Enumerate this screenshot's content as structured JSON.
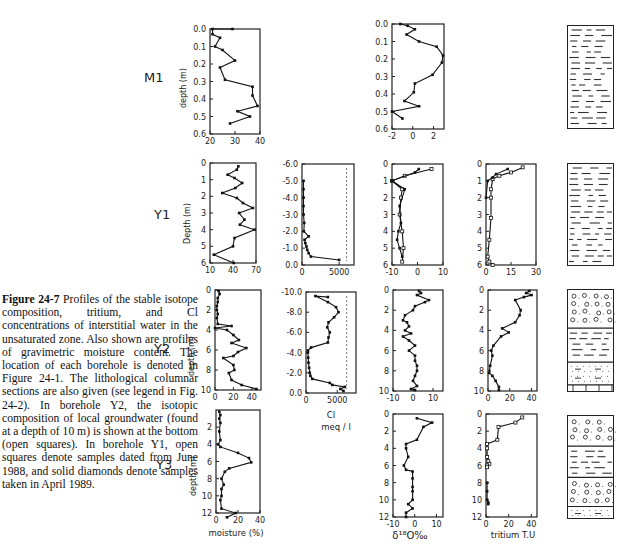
{
  "caption": {
    "figure_label": "Figure 24-7",
    "text": " Profiles of the stable isotope composition, tritium, and Cl concentrations of interstitial water in the unsaturated zone. Also shown are profiles of gravimetric moisture content. The location of each borehole is denoted in Figure 24-1. The lithological columnar sections are also given (see legend in Fig. 24-2). In borehole Y2, the isotopic composition of local groundwater (found at a depth of 10 m) is shown at the bottom (open squares). In borehole Y1, open squares denote samples dated from June 1988, and solid diamonds denote samples taken in April 1989."
  },
  "rows": [
    {
      "label": "M1",
      "ylabel": "depth (m)"
    },
    {
      "label": "Y1",
      "ylabel": "Depth (m)"
    },
    {
      "label": "Y2",
      "ylabel": "depth (m)"
    },
    {
      "label": "Y3",
      "ylabel": "depth (m)"
    }
  ],
  "x_labels": {
    "moisture": "moisture (%)",
    "cl": "Cl",
    "cl_unit": "meq / l",
    "d18o": "δ¹⁸O‰",
    "tritium": "tritium T.U"
  },
  "chart_data": [
    {
      "type": "line",
      "title": "M1 moisture",
      "xlabel": "moisture (%)",
      "ylabel": "depth (m)",
      "xlim": [
        20,
        40
      ],
      "ylim": [
        0.0,
        0.6
      ],
      "xticks": [
        20,
        30,
        40
      ],
      "yticks": [
        0.0,
        0.1,
        0.2,
        0.3,
        0.4,
        0.5,
        0.6
      ],
      "series": [
        {
          "name": "moisture",
          "x": [
            29,
            21,
            21,
            24,
            22,
            25,
            30,
            24,
            26,
            37,
            37,
            39,
            31,
            36,
            28
          ],
          "y": [
            0.0,
            0.0,
            0.03,
            0.05,
            0.1,
            0.12,
            0.18,
            0.22,
            0.29,
            0.33,
            0.38,
            0.44,
            0.47,
            0.5,
            0.54
          ]
        }
      ]
    },
    {
      "type": "line",
      "title": "M1 d18O",
      "xlabel": "δ18O ‰",
      "ylabel": "depth (m)",
      "xlim": [
        -2,
        3
      ],
      "ylim": [
        0.0,
        0.6
      ],
      "xticks": [
        -2,
        0,
        2
      ],
      "yticks": [
        0.0,
        0.1,
        0.2,
        0.3,
        0.4,
        0.5,
        0.6
      ],
      "series": [
        {
          "name": "d18O",
          "x": [
            -1.2,
            -0.5,
            0.2,
            -0.6,
            0.6,
            2.3,
            2.9,
            2.8,
            1.9,
            0.2,
            0.1,
            -0.8,
            0.6,
            -2.0,
            -1.0
          ],
          "y": [
            0.0,
            0.01,
            0.03,
            0.06,
            0.1,
            0.13,
            0.18,
            0.22,
            0.29,
            0.34,
            0.39,
            0.44,
            0.47,
            0.5,
            0.54
          ]
        }
      ]
    },
    {
      "type": "line",
      "title": "Y1 moisture",
      "xlabel": "moisture (%)",
      "ylabel": "Depth (m)",
      "xlim": [
        10,
        70
      ],
      "ylim": [
        0,
        6
      ],
      "xticks": [
        10,
        40,
        70
      ],
      "yticks": [
        0,
        1,
        2,
        3,
        4,
        5,
        6
      ],
      "series": [
        {
          "name": "moisture",
          "x": [
            47,
            45,
            33,
            42,
            52,
            43,
            26,
            45,
            53,
            66,
            48,
            55,
            49,
            68,
            42,
            40,
            15,
            41
          ],
          "y": [
            0.2,
            0.4,
            0.7,
            0.9,
            1.2,
            1.5,
            1.8,
            2.1,
            2.4,
            2.7,
            3.0,
            3.4,
            3.7,
            4.0,
            4.5,
            5.0,
            5.5,
            6.0
          ]
        }
      ]
    },
    {
      "type": "line",
      "title": "Y1 Cl",
      "xlabel": "Cl (meq/l)",
      "ylabel": "depth",
      "xlim": [
        0,
        7000
      ],
      "ylim": [
        -6,
        0
      ],
      "xticks": [
        0,
        5000
      ],
      "yticks": [
        0,
        -1,
        -2,
        -3,
        -4,
        -5,
        -6
      ],
      "series": [
        {
          "name": "Cl",
          "x": [
            5000,
            1200,
            900,
            700,
            600,
            450,
            350,
            900,
            250,
            300,
            200,
            200,
            200,
            200,
            200
          ],
          "y": [
            -0.3,
            -0.5,
            -0.7,
            -0.9,
            -1.1,
            -1.3,
            -1.5,
            -1.7,
            -2.0,
            -2.5,
            -3.0,
            -3.5,
            -4.0,
            -4.5,
            -5.0
          ]
        }
      ],
      "reference_line_x": 6000
    },
    {
      "type": "line",
      "title": "Y1 d18O",
      "xlabel": "δ18O ‰",
      "ylabel": "depth",
      "xlim": [
        -10,
        10
      ],
      "ylim": [
        0,
        6
      ],
      "xticks": [
        -10,
        0,
        10
      ],
      "yticks": [
        0,
        1,
        2,
        3,
        4,
        5,
        6
      ],
      "series": [
        {
          "name": "June 1988 (open squares)",
          "x": [
            5.5,
            -5,
            -10,
            -6,
            -6.5,
            -7,
            -6,
            -5.5,
            -6
          ],
          "y": [
            0.3,
            0.7,
            1.0,
            1.5,
            2.0,
            3.0,
            4.0,
            5.0,
            5.8
          ]
        },
        {
          "name": "April 1989 (solid diamonds)",
          "x": [
            0.5,
            -1,
            -10,
            -5,
            -7,
            -6.5,
            -7.5,
            -8,
            -7,
            -6
          ],
          "y": [
            0.3,
            0.5,
            1.0,
            1.5,
            2.5,
            3.5,
            4.0,
            4.5,
            5.0,
            5.5
          ]
        }
      ]
    },
    {
      "type": "line",
      "title": "Y1 tritium",
      "xlabel": "tritium T.U",
      "ylabel": "depth",
      "xlim": [
        0,
        30
      ],
      "ylim": [
        0,
        6
      ],
      "xticks": [
        0,
        15,
        30
      ],
      "yticks": [
        0,
        1,
        2,
        3,
        4,
        5,
        6
      ],
      "series": [
        {
          "name": "June 1988 (open squares)",
          "x": [
            22,
            15,
            8,
            4,
            3,
            3,
            3,
            2,
            1,
            2,
            4
          ],
          "y": [
            0.2,
            0.5,
            0.7,
            0.9,
            1.5,
            2.0,
            3.2,
            4.5,
            5.5,
            5.8,
            6.0
          ]
        },
        {
          "name": "April 1989 (solid diamonds)",
          "x": [
            13,
            6,
            4,
            1,
            0
          ],
          "y": [
            0.3,
            0.6,
            0.8,
            1.0,
            2.0
          ]
        }
      ]
    },
    {
      "type": "line",
      "title": "Y2 moisture",
      "xlabel": "moisture (%)",
      "ylabel": "depth (m)",
      "xlim": [
        0,
        50
      ],
      "ylim": [
        0,
        10
      ],
      "xticks": [
        0,
        20,
        40
      ],
      "yticks": [
        0,
        2,
        4,
        6,
        8,
        10
      ],
      "series": [
        {
          "name": "moisture",
          "x": [
            4,
            5,
            3,
            3,
            2,
            2,
            3,
            2,
            3,
            18,
            0,
            13,
            20,
            26,
            18,
            34,
            25,
            20,
            9,
            20,
            21,
            15,
            18,
            29,
            45
          ],
          "y": [
            0.1,
            0.4,
            0.8,
            1.2,
            1.6,
            2.0,
            2.4,
            2.8,
            3.4,
            3.6,
            3.8,
            4.0,
            4.5,
            5.0,
            5.3,
            5.8,
            6.2,
            6.6,
            6.8,
            7.5,
            8.0,
            8.3,
            9.0,
            9.5,
            9.9
          ]
        }
      ]
    },
    {
      "type": "line",
      "title": "Y2 Cl",
      "xlabel": "Cl (meq/l)",
      "ylabel": "depth",
      "xlim": [
        0,
        8000
      ],
      "ylim": [
        -10,
        0
      ],
      "xticks": [
        0,
        5000
      ],
      "yticks": [
        0,
        -2,
        -4,
        -6,
        -8,
        -10
      ],
      "series": [
        {
          "name": "Cl",
          "x": [
            6000,
            5500,
            6200,
            4200,
            3800,
            1000,
            700,
            600,
            500,
            400,
            350,
            300,
            300,
            800,
            3500,
            3600,
            3800,
            3400,
            3600,
            4500,
            5200,
            4800,
            3500,
            1500,
            3500
          ],
          "y": [
            -0.2,
            -0.4,
            -0.6,
            -0.8,
            -1.0,
            -1.4,
            -1.7,
            -2.0,
            -2.5,
            -3.0,
            -3.5,
            -4.0,
            -4.2,
            -4.5,
            -5.0,
            -5.5,
            -6.0,
            -6.5,
            -7.0,
            -7.5,
            -8.0,
            -8.5,
            -9.0,
            -9.6,
            -9.5
          ]
        }
      ],
      "reference_line_x": 6500
    },
    {
      "type": "line",
      "title": "Y2 d18O",
      "xlabel": "δ18O ‰",
      "ylabel": "depth (m)",
      "xlim": [
        -10,
        15
      ],
      "ylim": [
        0,
        10
      ],
      "xticks": [
        -10,
        0,
        10
      ],
      "yticks": [
        0,
        2,
        4,
        6,
        8,
        10
      ],
      "series": [
        {
          "name": "d18O",
          "x": [
            3,
            4,
            2,
            8,
            6,
            1,
            0,
            -4,
            -5,
            -3,
            -2,
            -4,
            -1,
            -5,
            -2,
            1,
            -2,
            1,
            1,
            2,
            2,
            1,
            0,
            2,
            -1,
            1
          ],
          "y": [
            0.1,
            0.3,
            0.5,
            1.0,
            1.2,
            1.6,
            2.0,
            2.5,
            3.0,
            3.2,
            3.6,
            4.0,
            4.3,
            4.6,
            5.0,
            5.5,
            6.0,
            6.5,
            7.0,
            7.5,
            8.0,
            8.5,
            9.0,
            9.5,
            9.8,
            9.9
          ]
        }
      ]
    },
    {
      "type": "line",
      "title": "Y2 tritium",
      "xlabel": "tritium T.U",
      "ylabel": "depth",
      "xlim": [
        0,
        45
      ],
      "ylim": [
        0,
        10
      ],
      "xticks": [
        0,
        20,
        40
      ],
      "yticks": [
        0,
        2,
        4,
        6,
        8,
        10
      ],
      "series": [
        {
          "name": "tritium",
          "x": [
            38,
            35,
            40,
            33,
            25,
            30,
            29,
            25,
            13,
            19,
            12,
            5,
            3,
            4,
            2,
            1,
            4,
            7,
            10,
            10
          ],
          "y": [
            0.1,
            0.3,
            0.5,
            0.7,
            1.0,
            2.0,
            2.5,
            3.2,
            3.8,
            4.2,
            4.6,
            5.5,
            6.0,
            6.5,
            7.5,
            8.2,
            8.5,
            9.0,
            9.6,
            9.9
          ]
        }
      ]
    },
    {
      "type": "line",
      "title": "Y3 moisture",
      "xlabel": "moisture (%)",
      "ylabel": "depth (m)",
      "xlim": [
        0,
        40
      ],
      "ylim": [
        0,
        12
      ],
      "xticks": [
        0,
        20,
        40
      ],
      "yticks": [
        2,
        4,
        6,
        8,
        10,
        12
      ],
      "series": [
        {
          "name": "moisture",
          "x": [
            3,
            4,
            3,
            4,
            3,
            4,
            2,
            4,
            20,
            30,
            32,
            12,
            8,
            5,
            7,
            5,
            5,
            4,
            5,
            18,
            10
          ],
          "y": [
            0.2,
            0.6,
            1.0,
            1.5,
            2.5,
            3.5,
            4.0,
            4.3,
            5.0,
            5.6,
            6.1,
            6.8,
            7.2,
            8.0,
            8.7,
            9.2,
            10.0,
            10.5,
            11.5,
            12.0,
            12.5
          ]
        }
      ]
    },
    {
      "type": "line",
      "title": "Y3 d18O",
      "xlabel": "δ18O ‰",
      "ylabel": "depth",
      "xlim": [
        -10,
        13
      ],
      "ylim": [
        0,
        12
      ],
      "xticks": [
        -10,
        0,
        10
      ],
      "yticks": [
        0,
        2,
        4,
        6,
        8,
        10,
        12
      ],
      "series": [
        {
          "name": "d18O",
          "x": [
            1,
            8,
            4,
            1,
            -4,
            -4,
            -3,
            -5,
            -4,
            -1,
            -1,
            -1,
            -1,
            -1,
            -3,
            -1,
            -4,
            -4
          ],
          "y": [
            0.5,
            1.0,
            1.5,
            3.0,
            3.5,
            4.0,
            5.0,
            6.0,
            6.5,
            6.7,
            7.5,
            8.5,
            9.0,
            10.0,
            10.5,
            11.0,
            11.5,
            12.0
          ]
        }
      ]
    },
    {
      "type": "line",
      "title": "Y3 tritium",
      "xlabel": "tritium T.U",
      "ylabel": "depth",
      "xlim": [
        0,
        45
      ],
      "ylim": [
        0,
        12
      ],
      "xticks": [
        0,
        20,
        40
      ],
      "yticks": [
        0,
        2,
        4,
        6,
        8,
        10,
        12
      ],
      "series": [
        {
          "name": "tritium",
          "x": [
            32,
            26,
            11,
            10,
            1,
            1,
            1,
            2,
            3,
            1,
            1
          ],
          "y": [
            0.4,
            1.0,
            1.5,
            3.0,
            3.5,
            4.0,
            5.0,
            5.5,
            5.8,
            6.0,
            6.2
          ]
        },
        {
          "name": "tritium deep",
          "x": [
            1,
            1,
            1,
            2,
            2
          ],
          "y": [
            8.0,
            9.0,
            10.0,
            10.3,
            10.5
          ]
        }
      ]
    }
  ],
  "lithology": [
    {
      "row": "M1",
      "layers": [
        "clay"
      ]
    },
    {
      "row": "Y1",
      "layers": [
        "clay"
      ]
    },
    {
      "row": "Y2",
      "layers": [
        "gravel",
        "clay",
        "silt",
        "base"
      ]
    },
    {
      "row": "Y3",
      "layers": [
        "gravel",
        "clay",
        "gravel",
        "silt"
      ]
    }
  ]
}
